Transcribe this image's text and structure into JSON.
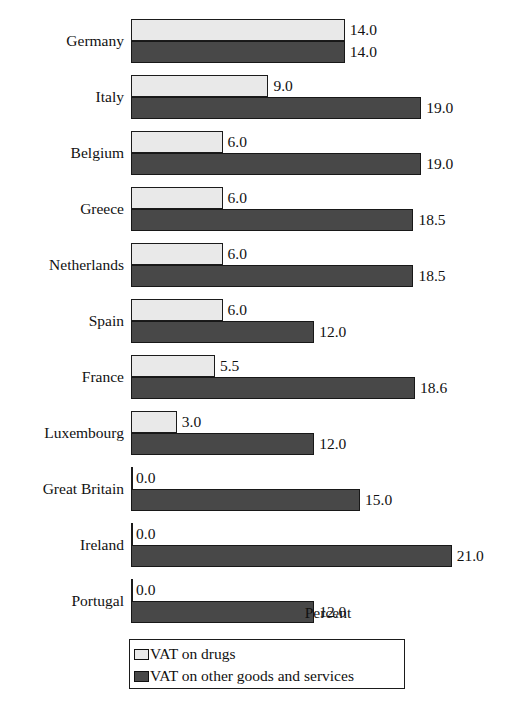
{
  "chart_data": {
    "type": "bar",
    "orientation": "horizontal",
    "title": "",
    "xlabel": "Percent",
    "ylabel": "",
    "grid": false,
    "xlim": [
      0,
      21
    ],
    "legend_position": "bottom-left",
    "categories": [
      "Germany",
      "Italy",
      "Belgium",
      "Greece",
      "Netherlands",
      "Spain",
      "France",
      "Luxembourg",
      "Great Britain",
      "Ireland",
      "Portugal"
    ],
    "series": [
      {
        "name": "VAT on drugs",
        "color": "#e9e9e9",
        "values": [
          14.0,
          9.0,
          6.0,
          6.0,
          6.0,
          6.0,
          5.5,
          3.0,
          0.0,
          0.0,
          0.0
        ],
        "labels": [
          "14.0",
          "9.0",
          "6.0",
          "6.0",
          "6.0",
          "6.0",
          "5.5",
          "3.0",
          "0.0",
          "0.0",
          "0.0"
        ]
      },
      {
        "name": "VAT on other goods and services",
        "color": "#484848",
        "values": [
          14.0,
          19.0,
          19.0,
          18.5,
          18.5,
          12.0,
          18.6,
          12.0,
          15.0,
          21.0,
          12.0
        ],
        "labels": [
          "14.0",
          "19.0",
          "19.0",
          "18.5",
          "18.5",
          "12.0",
          "18.6",
          "12.0",
          "15.0",
          "21.0",
          "12.0"
        ]
      }
    ]
  },
  "legend": {
    "items": [
      {
        "label": "VAT on drugs",
        "color": "#e9e9e9"
      },
      {
        "label": "VAT on other goods and services",
        "color": "#484848"
      }
    ]
  },
  "axis": {
    "x_title": "Percent"
  }
}
